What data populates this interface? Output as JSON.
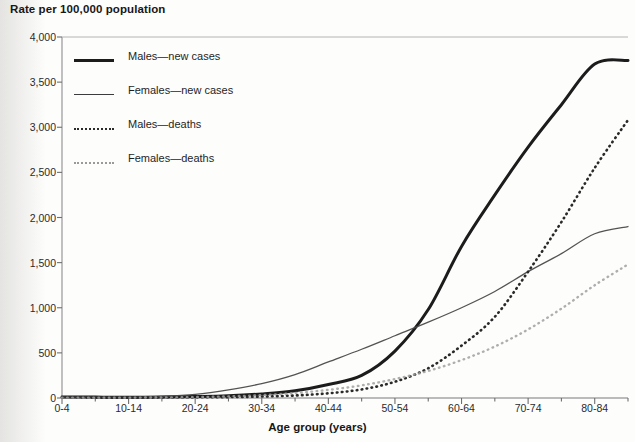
{
  "chart_data": {
    "type": "line",
    "title": "",
    "ylabel": "Rate per 100,000 population",
    "xlabel": "Age group (years)",
    "categories": [
      "0-4",
      "5-9",
      "10-14",
      "15-19",
      "20-24",
      "25-29",
      "30-34",
      "35-39",
      "40-44",
      "45-49",
      "50-54",
      "55-59",
      "60-64",
      "65-69",
      "70-74",
      "75-79",
      "80-84",
      "85+"
    ],
    "tick_labels_shown": [
      "0-4",
      "10-14",
      "20-24",
      "30-34",
      "40-44",
      "50-54",
      "60-64",
      "70-74",
      "80-84"
    ],
    "ylim": [
      0,
      4000
    ],
    "yticks": [
      0,
      500,
      1000,
      1500,
      2000,
      2500,
      3000,
      3500,
      4000
    ],
    "ytick_labels": [
      "0",
      "500",
      "1,000",
      "1,500",
      "2,000",
      "2,500",
      "3,000",
      "3,500",
      "4,000"
    ],
    "grid": false,
    "legend_position": "upper-left inside plot",
    "series": [
      {
        "name": "Males—new cases",
        "style": "solid-thick",
        "color": "#1c1c1c",
        "values": [
          12,
          10,
          9,
          11,
          16,
          25,
          45,
          80,
          150,
          250,
          520,
          980,
          1680,
          2250,
          2780,
          3250,
          3700,
          3740
        ]
      },
      {
        "name": "Females—new cases",
        "style": "solid-thin",
        "color": "#4a4a4a",
        "values": [
          10,
          9,
          10,
          18,
          40,
          90,
          160,
          260,
          400,
          540,
          690,
          840,
          1000,
          1180,
          1400,
          1600,
          1820,
          1900
        ]
      },
      {
        "name": "Males—deaths",
        "style": "dotted-dark",
        "color": "#2a2a2a",
        "values": [
          5,
          4,
          4,
          5,
          7,
          10,
          16,
          28,
          52,
          95,
          180,
          330,
          580,
          900,
          1400,
          1950,
          2550,
          3080
        ]
      },
      {
        "name": "Females—deaths",
        "style": "dotted-light",
        "color": "#a0a0a0",
        "values": [
          4,
          4,
          4,
          6,
          10,
          18,
          32,
          55,
          90,
          140,
          210,
          300,
          420,
          570,
          760,
          990,
          1250,
          1480
        ]
      }
    ]
  },
  "legend": {
    "items": [
      {
        "label": "Males—new cases",
        "key": "line-thick-solid-key"
      },
      {
        "label": "Females—new cases",
        "key": "line-thin-solid-key"
      },
      {
        "label": "Males—deaths",
        "key": "line-dotted-dark-key"
      },
      {
        "label": "Females—deaths",
        "key": "line-dotted-light-key"
      }
    ]
  },
  "axes": {
    "y_axis_title": "Rate per 100,000 population",
    "x_axis_title": "Age group (years)"
  },
  "colors": {
    "males_new_cases": "#1c1c1c",
    "females_new_cases": "#4a4a4a",
    "males_deaths": "#2a2a2a",
    "females_deaths": "#a0a0a0",
    "axis": "#6f6f6f",
    "text": "#1a1a1a",
    "background": "#fdfdfc"
  }
}
